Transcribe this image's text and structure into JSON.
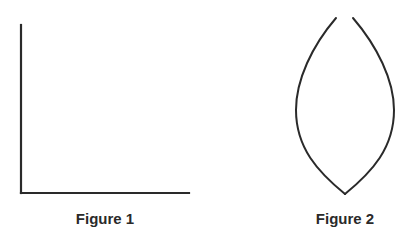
{
  "figures": [
    {
      "id": "figure-1",
      "caption": "Figure 1",
      "shape": "axes-corner",
      "description": "Vertical line joined to horizontal line forming an L (right angle)",
      "stroke_color": "#2a2a2a"
    },
    {
      "id": "figure-2",
      "caption": "Figure 2",
      "shape": "open-lens",
      "description": "Two curved arcs meeting at a bottom point, open at the top",
      "stroke_color": "#2a2a2a"
    }
  ],
  "colors": {
    "background": "#ffffff",
    "stroke": "#2a2a2a",
    "text": "#2a2a2a"
  }
}
